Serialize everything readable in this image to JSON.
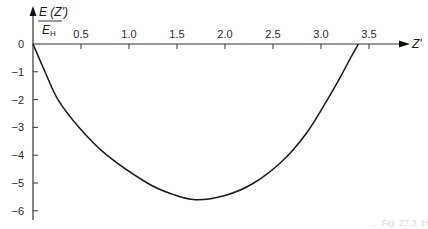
{
  "chart_data": {
    "type": "line",
    "title": "",
    "ylabel_numerator": "E (Z')",
    "ylabel_denominator": "E",
    "ylabel_denominator_sub": "H",
    "xlabel": "Z'",
    "x_ticks": [
      "0.5",
      "1.0",
      "1.5",
      "2.0",
      "2.5",
      "3.0",
      "3.5"
    ],
    "x_tick_values": [
      0.5,
      1.0,
      1.5,
      2.0,
      2.5,
      3.0,
      3.5
    ],
    "y_ticks": [
      "0",
      "−1",
      "−2",
      "−3",
      "−4",
      "−5",
      "−6"
    ],
    "y_tick_values": [
      0,
      -1,
      -2,
      -3,
      -4,
      -5,
      -6
    ],
    "xlim": [
      0,
      3.7
    ],
    "ylim": [
      -6.2,
      0
    ],
    "grid": false,
    "legend": null,
    "series": [
      {
        "name": "E(Z')/E_H",
        "x": [
          0,
          0.125,
          0.26,
          0.48,
          0.77,
          1.19,
          1.45,
          1.69,
          2.0,
          2.3,
          2.6,
          2.85,
          3.05,
          3.2,
          3.3,
          3.39
        ],
        "y": [
          0,
          -1.0,
          -2.0,
          -3.0,
          -4.0,
          -5.0,
          -5.4,
          -5.6,
          -5.45,
          -5.0,
          -4.2,
          -3.2,
          -2.1,
          -1.2,
          -0.55,
          0
        ]
      }
    ]
  },
  "caption_fragment": "... Fig. 27.3. H"
}
